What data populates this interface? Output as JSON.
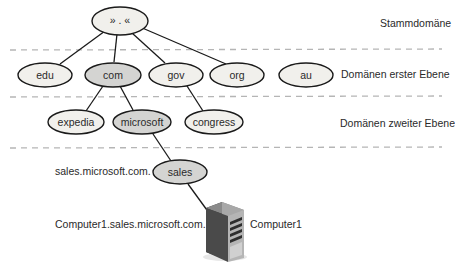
{
  "diagram": {
    "levels": {
      "root": "Stammdomäne",
      "first": "Domänen erster Ebene",
      "second": "Domänen zweiter Ebene"
    },
    "nodes": {
      "root": {
        "label": "» . «",
        "highlighted": false
      },
      "edu": {
        "label": "edu",
        "highlighted": false
      },
      "com": {
        "label": "com",
        "highlighted": true
      },
      "gov": {
        "label": "gov",
        "highlighted": false
      },
      "org": {
        "label": "org",
        "highlighted": false
      },
      "au": {
        "label": "au",
        "highlighted": false
      },
      "expedia": {
        "label": "expedia",
        "highlighted": false
      },
      "microsoft": {
        "label": "microsoft",
        "highlighted": true
      },
      "congress": {
        "label": "congress",
        "highlighted": false
      },
      "sales": {
        "label": "sales",
        "highlighted": true
      }
    },
    "edges": [
      [
        "root",
        "edu"
      ],
      [
        "root",
        "com"
      ],
      [
        "root",
        "gov"
      ],
      [
        "root",
        "org"
      ],
      [
        "com",
        "expedia"
      ],
      [
        "com",
        "microsoft"
      ],
      [
        "gov",
        "congress"
      ],
      [
        "microsoft",
        "sales"
      ],
      [
        "sales",
        "computer1"
      ]
    ],
    "annotations": {
      "sales_fqdn": "sales.microsoft.com.",
      "host_fqdn": "Computer1.sales.microsoft.com.",
      "host_name": "Computer1"
    },
    "colors": {
      "node_fill": "#f1f0ec",
      "node_highlight_fill": "#d4d4d2",
      "node_stroke": "#1a1a1a",
      "edge": "#1a1a1a",
      "dashed_separator": "#b5b5b5",
      "server_dark": "#3a3a3a",
      "server_light": "#9a9a9a"
    }
  }
}
